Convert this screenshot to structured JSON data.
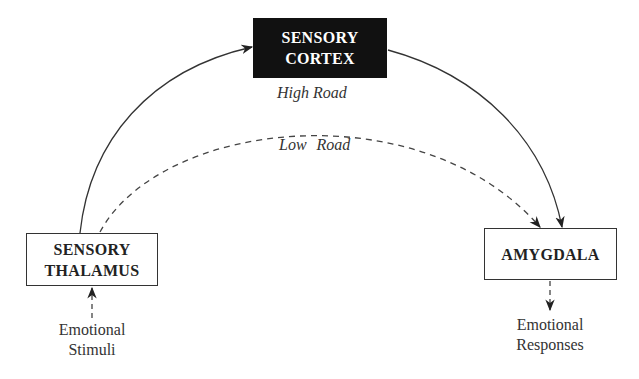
{
  "diagram": {
    "nodes": {
      "sensory_cortex": {
        "line1": "SENSORY",
        "line2": "CORTEX",
        "style": "dark"
      },
      "sensory_thalamus": {
        "line1": "SENSORY",
        "line2": "THALAMUS",
        "style": "outlined"
      },
      "amygdala": {
        "line1": "AMYGDALA",
        "style": "outlined"
      }
    },
    "edge_labels": {
      "high_road": "High Road",
      "low_road": "Low Road"
    },
    "input": {
      "line1": "Emotional",
      "line2": "Stimuli"
    },
    "output": {
      "line1": "Emotional",
      "line2": "Responses"
    },
    "edges": [
      {
        "from": "sensory_thalamus",
        "to": "sensory_cortex",
        "style": "solid",
        "label": "High Road"
      },
      {
        "from": "sensory_cortex",
        "to": "amygdala",
        "style": "solid",
        "label": "High Road"
      },
      {
        "from": "sensory_thalamus",
        "to": "amygdala",
        "style": "dashed",
        "label": "Low Road"
      },
      {
        "from": "emotional_stimuli",
        "to": "sensory_thalamus",
        "style": "dashed"
      },
      {
        "from": "amygdala",
        "to": "emotional_responses",
        "style": "dashed"
      }
    ],
    "colors": {
      "dark_box": "#111111",
      "line": "#333333",
      "background": "#ffffff"
    }
  }
}
